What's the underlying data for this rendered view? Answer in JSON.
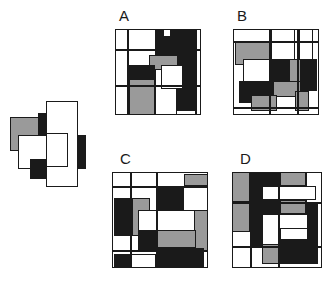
{
  "page": {
    "type": "visual-pattern-reasoning-puzzle",
    "background_color": "#ffffff",
    "width": 333,
    "height": 287
  },
  "palette": {
    "black": "#1a1a1a",
    "gray": "#9a9a9a",
    "white": "#ffffff",
    "outline": "#1a1a1a",
    "label_color": "#1a1a1a"
  },
  "reference": {
    "name": "reference-figure",
    "label": "",
    "x": 8,
    "y": 95,
    "width": 86,
    "height": 86,
    "shapes": [
      {
        "fill": "gray",
        "x": 2,
        "y": 22,
        "w": 34,
        "h": 34,
        "stroke": true
      },
      {
        "fill": "black",
        "x": 30,
        "y": 18,
        "w": 30,
        "h": 28,
        "stroke": false
      },
      {
        "fill": "white",
        "x": 10,
        "y": 40,
        "w": 36,
        "h": 34,
        "stroke": true
      },
      {
        "fill": "gray",
        "x": 44,
        "y": 40,
        "w": 30,
        "h": 34,
        "stroke": false
      },
      {
        "fill": "black",
        "x": 56,
        "y": 40,
        "w": 22,
        "h": 34,
        "stroke": true
      },
      {
        "fill": "black",
        "x": 22,
        "y": 64,
        "w": 34,
        "h": 20,
        "stroke": true
      },
      {
        "fill": "gray",
        "x": 44,
        "y": 64,
        "w": 26,
        "h": 20,
        "stroke": false
      },
      {
        "fill": "white",
        "x": 38,
        "y": 6,
        "w": 32,
        "h": 86,
        "stroke": true
      },
      {
        "fill": "white",
        "x": 38,
        "y": 38,
        "w": 22,
        "h": 34,
        "stroke": true
      }
    ]
  },
  "options": [
    {
      "id": "A",
      "label": "A",
      "label_x": 119,
      "label_y": 8,
      "x": 115,
      "y": 29,
      "width": 86,
      "height": 86,
      "shapes": [
        {
          "fill": "white",
          "x": 0,
          "y": 0,
          "w": 86,
          "h": 86,
          "stroke": true
        },
        {
          "fill": "white",
          "x": 0,
          "y": 20,
          "w": 86,
          "h": 0,
          "stroke": true
        },
        {
          "fill": "black",
          "x": 40,
          "y": 0,
          "w": 40,
          "h": 26,
          "stroke": true
        },
        {
          "fill": "white",
          "x": 48,
          "y": 0,
          "w": 8,
          "h": 8,
          "stroke": true
        },
        {
          "fill": "gray",
          "x": 34,
          "y": 26,
          "w": 34,
          "h": 22,
          "stroke": true
        },
        {
          "fill": "black",
          "x": 14,
          "y": 36,
          "w": 26,
          "h": 22,
          "stroke": true
        },
        {
          "fill": "black",
          "x": 62,
          "y": 26,
          "w": 18,
          "h": 56,
          "stroke": true
        },
        {
          "fill": "gray",
          "x": 14,
          "y": 50,
          "w": 26,
          "h": 36,
          "stroke": true
        },
        {
          "fill": "white",
          "x": 40,
          "y": 40,
          "w": 22,
          "h": 46,
          "stroke": true
        },
        {
          "fill": "white",
          "x": 46,
          "y": 36,
          "w": 22,
          "h": 24,
          "stroke": true
        }
      ],
      "lines": [
        {
          "orient": "h",
          "x": 0,
          "y": 20,
          "len": 86
        },
        {
          "orient": "h",
          "x": 0,
          "y": 56,
          "len": 86
        },
        {
          "orient": "v",
          "x": 12,
          "y": 0,
          "len": 86
        },
        {
          "orient": "v",
          "x": 80,
          "y": 0,
          "len": 86
        }
      ]
    },
    {
      "id": "B",
      "label": "B",
      "label_x": 237,
      "label_y": 8,
      "x": 233,
      "y": 29,
      "width": 86,
      "height": 86,
      "shapes": [
        {
          "fill": "white",
          "x": 0,
          "y": 0,
          "w": 86,
          "h": 86,
          "stroke": true
        },
        {
          "fill": "gray",
          "x": 2,
          "y": 12,
          "w": 46,
          "h": 24,
          "stroke": true
        },
        {
          "fill": "white",
          "x": 38,
          "y": 0,
          "w": 24,
          "h": 36,
          "stroke": true
        },
        {
          "fill": "white",
          "x": 66,
          "y": 0,
          "w": 14,
          "h": 36,
          "stroke": true
        },
        {
          "fill": "white",
          "x": 10,
          "y": 30,
          "w": 32,
          "h": 28,
          "stroke": true
        },
        {
          "fill": "black",
          "x": 38,
          "y": 30,
          "w": 18,
          "h": 32,
          "stroke": true
        },
        {
          "fill": "gray",
          "x": 56,
          "y": 30,
          "w": 12,
          "h": 32,
          "stroke": true
        },
        {
          "fill": "black",
          "x": 68,
          "y": 30,
          "w": 16,
          "h": 32,
          "stroke": true
        },
        {
          "fill": "black",
          "x": 6,
          "y": 52,
          "w": 34,
          "h": 22,
          "stroke": true
        },
        {
          "fill": "gray",
          "x": 40,
          "y": 52,
          "w": 28,
          "h": 16,
          "stroke": true
        },
        {
          "fill": "gray",
          "x": 18,
          "y": 66,
          "w": 26,
          "h": 16,
          "stroke": true
        },
        {
          "fill": "gray",
          "x": 62,
          "y": 62,
          "w": 14,
          "h": 20,
          "stroke": true
        }
      ],
      "lines": [
        {
          "orient": "h",
          "x": 0,
          "y": 12,
          "len": 86
        },
        {
          "orient": "v",
          "x": 36,
          "y": 0,
          "len": 86
        },
        {
          "orient": "v",
          "x": 64,
          "y": 0,
          "len": 86
        },
        {
          "orient": "h",
          "x": 0,
          "y": 78,
          "len": 86
        }
      ]
    },
    {
      "id": "C",
      "label": "C",
      "label_x": 120,
      "label_y": 151,
      "x": 112,
      "y": 172,
      "width": 96,
      "height": 96,
      "shapes": [
        {
          "fill": "white",
          "x": 0,
          "y": 0,
          "w": 96,
          "h": 96,
          "stroke": true
        },
        {
          "fill": "gray",
          "x": 72,
          "y": 2,
          "w": 24,
          "h": 12,
          "stroke": true
        },
        {
          "fill": "black",
          "x": 44,
          "y": 14,
          "w": 28,
          "h": 24,
          "stroke": true
        },
        {
          "fill": "black",
          "x": 2,
          "y": 26,
          "w": 18,
          "h": 38,
          "stroke": true
        },
        {
          "fill": "gray",
          "x": 20,
          "y": 26,
          "w": 18,
          "h": 38,
          "stroke": true
        },
        {
          "fill": "white",
          "x": 26,
          "y": 38,
          "w": 66,
          "h": 24,
          "stroke": true
        },
        {
          "fill": "gray",
          "x": 82,
          "y": 38,
          "w": 14,
          "h": 42,
          "stroke": true
        },
        {
          "fill": "black",
          "x": 26,
          "y": 58,
          "w": 18,
          "h": 22,
          "stroke": true
        },
        {
          "fill": "gray",
          "x": 44,
          "y": 58,
          "w": 40,
          "h": 18,
          "stroke": true
        },
        {
          "fill": "black",
          "x": 44,
          "y": 76,
          "w": 48,
          "h": 20,
          "stroke": true
        },
        {
          "fill": "black",
          "x": 2,
          "y": 82,
          "w": 16,
          "h": 14,
          "stroke": true
        },
        {
          "fill": "white",
          "x": 18,
          "y": 82,
          "w": 26,
          "h": 14,
          "stroke": true
        }
      ],
      "lines": [
        {
          "orient": "h",
          "x": 0,
          "y": 14,
          "len": 96
        },
        {
          "orient": "h",
          "x": 0,
          "y": 78,
          "len": 96
        },
        {
          "orient": "v",
          "x": 18,
          "y": 0,
          "len": 96
        },
        {
          "orient": "v",
          "x": 44,
          "y": 0,
          "len": 96
        }
      ]
    },
    {
      "id": "D",
      "label": "D",
      "label_x": 240,
      "label_y": 151,
      "x": 232,
      "y": 172,
      "width": 90,
      "height": 96,
      "shapes": [
        {
          "fill": "white",
          "x": 0,
          "y": 0,
          "w": 90,
          "h": 96,
          "stroke": true
        },
        {
          "fill": "gray",
          "x": 0,
          "y": 0,
          "w": 18,
          "h": 30,
          "stroke": true
        },
        {
          "fill": "black",
          "x": 18,
          "y": 0,
          "w": 30,
          "h": 74,
          "stroke": true
        },
        {
          "fill": "gray",
          "x": 48,
          "y": 0,
          "w": 26,
          "h": 14,
          "stroke": true
        },
        {
          "fill": "white",
          "x": 74,
          "y": 0,
          "w": 16,
          "h": 32,
          "stroke": true
        },
        {
          "fill": "white",
          "x": 30,
          "y": 14,
          "w": 54,
          "h": 14,
          "stroke": true
        },
        {
          "fill": "gray",
          "x": 0,
          "y": 30,
          "w": 18,
          "h": 30,
          "stroke": true
        },
        {
          "fill": "gray",
          "x": 48,
          "y": 28,
          "w": 26,
          "h": 14,
          "stroke": true
        },
        {
          "fill": "black",
          "x": 74,
          "y": 32,
          "w": 12,
          "h": 42,
          "stroke": true
        },
        {
          "fill": "white",
          "x": 30,
          "y": 42,
          "w": 46,
          "h": 32,
          "stroke": true
        },
        {
          "fill": "white",
          "x": 48,
          "y": 56,
          "w": 28,
          "h": 12,
          "stroke": true
        },
        {
          "fill": "gray",
          "x": 30,
          "y": 72,
          "w": 18,
          "h": 20,
          "stroke": true
        },
        {
          "fill": "black",
          "x": 48,
          "y": 68,
          "w": 38,
          "h": 24,
          "stroke": true
        }
      ],
      "lines": [
        {
          "orient": "h",
          "x": 0,
          "y": 30,
          "len": 90
        },
        {
          "orient": "h",
          "x": 0,
          "y": 74,
          "len": 90
        },
        {
          "orient": "v",
          "x": 18,
          "y": 0,
          "len": 96
        },
        {
          "orient": "v",
          "x": 46,
          "y": 0,
          "len": 96
        }
      ]
    }
  ]
}
